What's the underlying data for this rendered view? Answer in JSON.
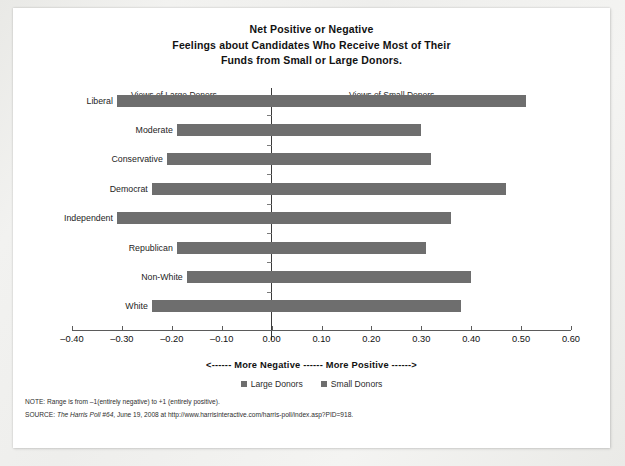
{
  "title": {
    "line1": "Net Positive or Negative",
    "line2": "Feelings about Candidates Who Receive Most of Their",
    "line3": "Funds from Small or Large Donors."
  },
  "annotations": {
    "left": "Views of Large Donors",
    "right": "Views of Small Donors"
  },
  "axis": {
    "caption": "<------ More Negative ------ More Positive ------>",
    "tick_labels": [
      "–0.40",
      "–0.30",
      "–0.20",
      "–0.10",
      "0.00",
      "0.10",
      "0.20",
      "0.30",
      "0.40",
      "0.50",
      "0.60"
    ]
  },
  "legend": {
    "items": [
      {
        "label": "Large Donors",
        "color": "#6e6e6e"
      },
      {
        "label": "Small Donors",
        "color": "#6e6e6e"
      }
    ]
  },
  "notes": {
    "note_prefix": "NOTE: ",
    "note_text": "Range is from –1(entirely negative) to +1 (entirely positive).",
    "source_prefix": "SOURCE: ",
    "source_italic": "The Harris Poll #64",
    "source_rest": ", June 19, 2008 at http://www.harrisinteractive.com/harris-poll/index.asp?PID=918."
  },
  "colors": {
    "bar": "#6e6e6e",
    "zero_line": "#3a3a3a",
    "axis": "#5b5b5b",
    "paper": "#ffffff"
  },
  "chart_data": {
    "type": "bar",
    "orientation": "horizontal",
    "title": "Net Positive or Negative Feelings about Candidates Who Receive Most of Their Funds from Small or Large Donors.",
    "xlabel": "<------ More Negative ------ More Positive ------>",
    "ylabel": "",
    "xlim": [
      -0.4,
      0.6
    ],
    "xticks": [
      -0.4,
      -0.3,
      -0.2,
      -0.1,
      0.0,
      0.1,
      0.2,
      0.3,
      0.4,
      0.5,
      0.6
    ],
    "grid": false,
    "legend_position": "bottom",
    "note": "Each row is a single bar spanning from its Large-Donors (negative) value to its Small-Donors (positive) value.",
    "categories": [
      "Liberal",
      "Moderate",
      "Conservative",
      "Democrat",
      "Independent",
      "Republican",
      "Non-White",
      "White"
    ],
    "series": [
      {
        "name": "Large Donors",
        "values": [
          -0.31,
          -0.19,
          -0.21,
          -0.24,
          -0.31,
          -0.19,
          -0.17,
          -0.24
        ]
      },
      {
        "name": "Small Donors",
        "values": [
          0.51,
          0.3,
          0.32,
          0.47,
          0.36,
          0.31,
          0.4,
          0.38
        ]
      }
    ],
    "rows": [
      {
        "category": "Liberal",
        "large_donors": -0.31,
        "small_donors": 0.51
      },
      {
        "category": "Moderate",
        "large_donors": -0.19,
        "small_donors": 0.3
      },
      {
        "category": "Conservative",
        "large_donors": -0.21,
        "small_donors": 0.32
      },
      {
        "category": "Democrat",
        "large_donors": -0.24,
        "small_donors": 0.47
      },
      {
        "category": "Independent",
        "large_donors": -0.31,
        "small_donors": 0.36
      },
      {
        "category": "Republican",
        "large_donors": -0.19,
        "small_donors": 0.31
      },
      {
        "category": "Non-White",
        "large_donors": -0.17,
        "small_donors": 0.4
      },
      {
        "category": "White",
        "large_donors": -0.24,
        "small_donors": 0.38
      }
    ]
  }
}
